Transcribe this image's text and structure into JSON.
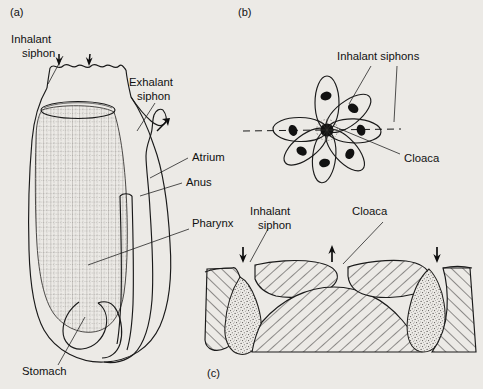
{
  "figure": {
    "background_color": "#eceae6",
    "ink_color": "#1a1a1a"
  },
  "panels": [
    {
      "id": "a",
      "letter": "(a)",
      "caption": "Solitary ascidian longitudinal section",
      "labels": [
        {
          "name": "inhalant-siphon",
          "lines": [
            "Inhalant",
            "siphon"
          ],
          "x": 35,
          "y": 40
        },
        {
          "name": "exhalant-siphon",
          "lines": [
            "Exhalant",
            "siphon"
          ],
          "x": 157,
          "y": 89
        },
        {
          "name": "atrium",
          "lines": [
            "Atrium"
          ],
          "x": 192,
          "y": 158
        },
        {
          "name": "anus",
          "lines": [
            "Anus"
          ],
          "x": 186,
          "y": 183
        },
        {
          "name": "pharynx",
          "lines": [
            "Pharynx"
          ],
          "x": 192,
          "y": 224
        },
        {
          "name": "stomach",
          "lines": [
            "Stomach"
          ],
          "x": 49,
          "y": 372
        }
      ],
      "arrows": [
        {
          "name": "inhalant-flow-arrow-left",
          "direction": "down"
        },
        {
          "name": "inhalant-flow-arrow-right",
          "direction": "down"
        },
        {
          "name": "exhalant-flow-arrow",
          "direction": "up-right"
        }
      ]
    },
    {
      "id": "b",
      "letter": "(b)",
      "caption": "Colonial system viewed from above",
      "lobe_count": 7,
      "labels": [
        {
          "name": "inhalant-siphons",
          "lines": [
            "Inhalant siphons"
          ],
          "x": 337,
          "y": 57
        },
        {
          "name": "cloaca",
          "lines": [
            "Cloaca"
          ],
          "x": 404,
          "y": 159
        }
      ]
    },
    {
      "id": "c",
      "letter": "(c)",
      "caption": "Colony cross-section showing water flow",
      "labels": [
        {
          "name": "inhalant-siphon",
          "lines": [
            "Inhalant",
            "siphon"
          ],
          "x": 261,
          "y": 216
        },
        {
          "name": "cloaca",
          "lines": [
            "Cloaca"
          ],
          "x": 375,
          "y": 214
        }
      ],
      "arrows": [
        {
          "name": "inhalant-flow-arrow-left",
          "direction": "down"
        },
        {
          "name": "cloacal-flow-arrow-centre",
          "direction": "up"
        },
        {
          "name": "inhalant-flow-arrow-right",
          "direction": "down"
        }
      ]
    }
  ]
}
